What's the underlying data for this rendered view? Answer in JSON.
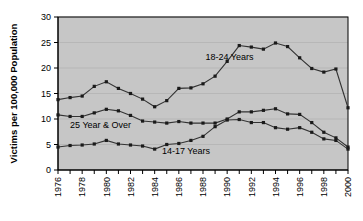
{
  "chart_data": {
    "type": "line",
    "title": "",
    "xlabel": "",
    "ylabel": "Victims per 100,000 Population",
    "ylim": [
      0,
      30
    ],
    "yticks": [
      0,
      5,
      10,
      15,
      20,
      25,
      30
    ],
    "ytick_labels": [
      "0",
      "5",
      "10",
      "15",
      "20",
      "25",
      "30"
    ],
    "xlim": [
      1976,
      2000
    ],
    "x": [
      1976,
      1977,
      1978,
      1979,
      1980,
      1981,
      1982,
      1983,
      1984,
      1985,
      1986,
      1987,
      1988,
      1989,
      1990,
      1991,
      1992,
      1993,
      1994,
      1995,
      1996,
      1997,
      1998,
      1999,
      2000
    ],
    "xtick_labels": [
      "1976",
      "1977",
      "1978",
      "1979",
      "1980",
      "1981",
      "1982",
      "1983",
      "1984",
      "1985",
      "1986",
      "1987",
      "1988",
      "1989",
      "1990",
      "1991",
      "1992",
      "1993",
      "1994",
      "1995",
      "1996",
      "1997",
      "1998",
      "1999",
      "2000"
    ],
    "xtick_labels_shown": [
      "1976",
      "1978",
      "1980",
      "1982",
      "1984",
      "1986",
      "1988",
      "1990",
      "1992",
      "1994",
      "1996",
      "1998",
      "2000"
    ],
    "grid": true,
    "grid_axis": "y",
    "legend_position": "inline-annotations",
    "plot_background": "#c6c6c6",
    "line_color": "#333333",
    "marker_color": "#1a1a1a",
    "series": [
      {
        "name": "18-24 Years",
        "label_x": 1988.2,
        "label_y": 21.5,
        "values": [
          13.8,
          14.2,
          14.5,
          16.4,
          17.3,
          16.0,
          15.0,
          13.9,
          12.4,
          13.6,
          16.0,
          16.1,
          16.9,
          18.4,
          21.3,
          24.4,
          24.1,
          23.7,
          24.9,
          24.2,
          22.0,
          19.9,
          19.2,
          19.8,
          15.0
        ]
      },
      {
        "name": "25 Year & Over",
        "label_x": 1977.0,
        "label_y": 8.2,
        "values": [
          10.8,
          10.5,
          10.5,
          11.2,
          11.9,
          11.6,
          10.7,
          9.6,
          9.4,
          9.2,
          9.5,
          9.2,
          9.2,
          9.2,
          10.0,
          11.4,
          11.4,
          11.7,
          12.0,
          11.0,
          10.9,
          9.3,
          7.4,
          6.3,
          5.5
        ]
      },
      {
        "name": "14-17 Years",
        "label_x": 1984.6,
        "label_y": 3.1,
        "values": [
          4.5,
          4.8,
          4.9,
          5.1,
          5.8,
          5.1,
          4.9,
          4.7,
          4.1,
          5.0,
          5.2,
          5.8,
          6.6,
          8.5,
          9.8,
          9.9,
          9.3,
          9.3,
          8.3,
          8.0,
          8.3,
          7.4,
          6.1,
          5.8,
          4.2
        ]
      }
    ],
    "series_endpoints_note": {
      "18-24 Years": {
        "2000": 12.2
      },
      "25 Year & Over": {
        "2000": 4.5
      },
      "14-17 Years": {
        "2000": 4.1
      }
    }
  },
  "axis": {
    "ylabel": "Victims per 100,000 Population"
  }
}
